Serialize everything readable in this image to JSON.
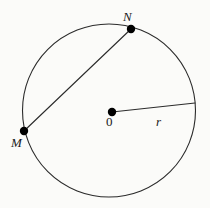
{
  "figure": {
    "background_color": "#fbfbf9",
    "stroke_color": "#2b2b2b",
    "point_color": "#000000",
    "labels": {
      "point_n": "N",
      "point_m": "M",
      "center": "0",
      "radius": "r"
    }
  },
  "chart_data": {
    "type": "diagram",
    "shapes": [
      {
        "name": "circle",
        "kind": "circle",
        "cx": 109,
        "cy": 110.5,
        "r": 86.5,
        "stroke": "#2b2b2b",
        "stroke_width": 1.1,
        "fill": "none"
      },
      {
        "name": "chord-mn",
        "kind": "line",
        "x1": 24,
        "y1": 131,
        "x2": 131,
        "y2": 29,
        "stroke": "#2b2b2b",
        "stroke_width": 1.1
      },
      {
        "name": "radius-segment",
        "kind": "line",
        "x1": 112,
        "y1": 112,
        "x2": 195,
        "y2": 103,
        "stroke": "#2b2b2b",
        "stroke_width": 1.1
      }
    ],
    "points": [
      {
        "name": "N",
        "label": "N",
        "x": 131,
        "y": 29,
        "on": "circle",
        "dot_radius": 4.2
      },
      {
        "name": "M",
        "label": "M",
        "x": 24,
        "y": 131,
        "on": "circle",
        "dot_radius": 4.2
      },
      {
        "name": "O",
        "label": "0",
        "x": 112,
        "y": 112,
        "on": "center",
        "dot_radius": 4.2
      }
    ],
    "annotations": [
      {
        "name": "label-N",
        "text": "N",
        "x": 123,
        "y": 10,
        "style": "italic-serif"
      },
      {
        "name": "label-M",
        "text": "M",
        "x": 11,
        "y": 136,
        "style": "italic-serif"
      },
      {
        "name": "label-O",
        "text": "0",
        "x": 106,
        "y": 115,
        "style": "serif"
      },
      {
        "name": "label-r",
        "text": "r",
        "x": 156,
        "y": 115,
        "style": "italic-serif"
      }
    ],
    "xlabel": "",
    "ylabel": "",
    "grid": false,
    "legend": false
  }
}
